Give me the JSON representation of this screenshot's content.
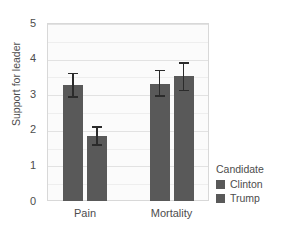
{
  "chart_data": {
    "type": "bar",
    "title": "",
    "xlabel": "",
    "ylabel": "Support for leader",
    "categories": [
      "Pain",
      "Mortality"
    ],
    "series": [
      {
        "name": "Clinton",
        "values": [
          3.25,
          3.3
        ],
        "err_low": [
          2.9,
          2.93
        ],
        "err_high": [
          3.6,
          3.68
        ],
        "color": "#595959"
      },
      {
        "name": "Trump",
        "values": [
          1.82,
          3.5
        ],
        "err_low": [
          1.55,
          3.08
        ],
        "err_high": [
          2.1,
          3.9
        ],
        "color": "#595959"
      }
    ],
    "ylim": [
      0,
      5
    ],
    "yticks": [
      0,
      1,
      2,
      3,
      4,
      5
    ],
    "ytick_labels": [
      "0",
      "1",
      "2",
      "3",
      "4",
      "5"
    ],
    "grid": true,
    "legend": {
      "title": "Candidate",
      "position": "right",
      "entries": [
        "Clinton",
        "Trump"
      ]
    },
    "panel_background": "#fbfbfb",
    "bar_color": "#595959",
    "errorbar_color": "#2b2b2b",
    "gridline_color": "#e2e2e2"
  },
  "axis": {
    "y_label": "Support for leader",
    "y_ticks": [
      "0",
      "1",
      "2",
      "3",
      "4",
      "5"
    ],
    "x_ticks": [
      "Pain",
      "Mortality"
    ]
  },
  "legend": {
    "title": "Candidate",
    "items": [
      {
        "label": "Clinton",
        "color": "#595959"
      },
      {
        "label": "Trump",
        "color": "#595959"
      }
    ]
  }
}
